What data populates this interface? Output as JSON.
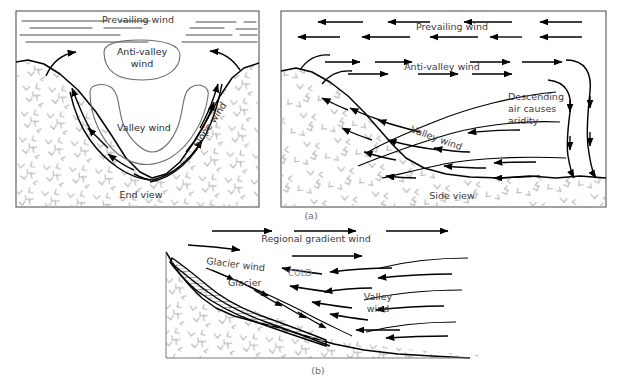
{
  "figure": {
    "background_color": "#ffffff",
    "line_color": "#000000",
    "terrain_hatch_color": "#b0b0b0",
    "label_color": "#3b3b3b",
    "captions": [
      {
        "id": "a",
        "text": "(a)"
      },
      {
        "id": "b",
        "text": "(b)"
      }
    ]
  },
  "panel_end_view": {
    "name": "End view panel",
    "view_label": "End view",
    "labels": {
      "prevailing_wind": "Prevailing wind",
      "anti_valley_wind_line1": "Anti-valley",
      "anti_valley_wind_line2": "wind",
      "valley_wind": "Valley wind",
      "slope_wind": "Slope wind"
    }
  },
  "panel_side_view": {
    "name": "Side view panel",
    "view_label": "Side view",
    "labels": {
      "prevailing_wind": "Prevailing wind",
      "anti_valley_wind": "Anti-valley wind",
      "valley_wind": "Valley wind",
      "descending_line1": "Descending",
      "descending_line2": "air causes",
      "descending_line3": "aridity"
    }
  },
  "panel_glacier": {
    "name": "Glacier wind panel",
    "labels": {
      "regional_gradient_wind": "Regional gradient wind",
      "glacier_wind": "Glacier wind",
      "glacier": "Glacier",
      "cold": "COLD",
      "valley_wind_line1": "Valley",
      "valley_wind_line2": "wind"
    }
  }
}
